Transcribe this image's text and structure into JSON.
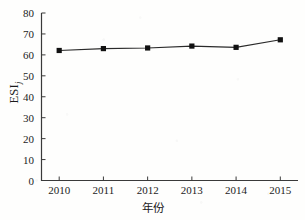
{
  "chart_data": {
    "type": "line",
    "title": "",
    "subtitle": "",
    "xlabel": "年份",
    "ylabel": "ESI",
    "ylabel_subscript": "j",
    "categories": [
      "2010",
      "2011",
      "2012",
      "2013",
      "2014",
      "2015"
    ],
    "x": [
      2010,
      2011,
      2012,
      2013,
      2014,
      2015
    ],
    "values": [
      62.1,
      63.0,
      63.3,
      64.2,
      63.6,
      67.2
    ],
    "series": [
      {
        "name": "ESIj",
        "values": [
          62.1,
          63.0,
          63.3,
          64.2,
          63.6,
          67.2
        ],
        "marker": "square",
        "marker_color": "#111111",
        "line_color": "#2a2a2a"
      }
    ],
    "xlim": [
      2009.6,
      2015.4
    ],
    "ylim": [
      0,
      80
    ],
    "ytick_labels": [
      "0",
      "10",
      "20",
      "30",
      "40",
      "50",
      "60",
      "70",
      "80"
    ],
    "yticks": [
      0,
      10,
      20,
      30,
      40,
      50,
      60,
      70,
      80
    ],
    "xtick_labels": [
      "2010",
      "2011",
      "2012",
      "2013",
      "2014",
      "2015"
    ],
    "grid": false,
    "legend": "none",
    "tick_direction": "in",
    "spines": [
      "left",
      "bottom"
    ],
    "annotations": []
  },
  "colors": {
    "axis": "#3a3a3a",
    "line": "#2a2a2a",
    "marker": "#111111",
    "text": "#1c1c1c",
    "background": "#fefefd"
  }
}
